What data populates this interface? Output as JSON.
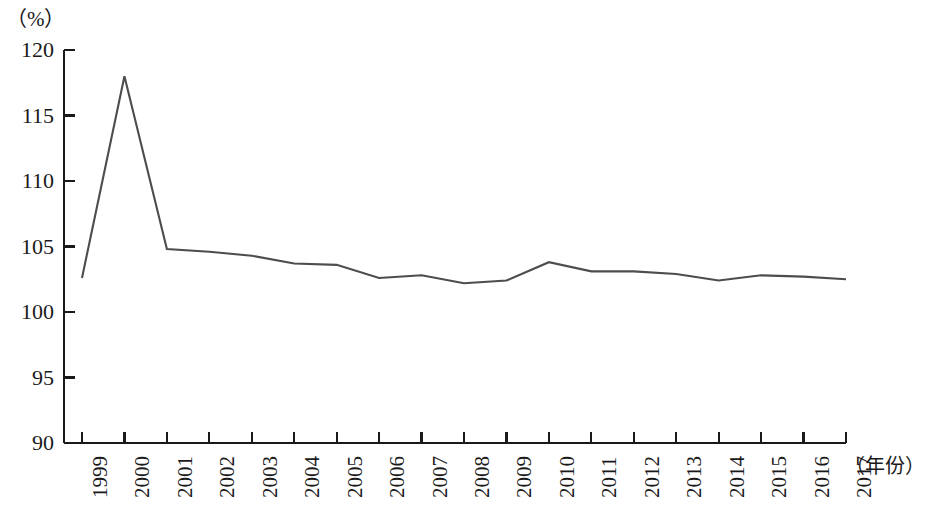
{
  "chart_data": {
    "type": "line",
    "title": "",
    "subtitle": "",
    "unit_label": "（%）",
    "xlabel": "（年份）",
    "ylabel": "",
    "grid": false,
    "legend": null,
    "ylim": [
      90,
      120
    ],
    "yticks": [
      120,
      115,
      110,
      105,
      100,
      95,
      90
    ],
    "ytick_labels": [
      "120",
      "115",
      "110",
      "105",
      "100",
      "95",
      "90"
    ],
    "categories": [
      "1999",
      "2000",
      "2001",
      "2002",
      "2003",
      "2004",
      "2005",
      "2006",
      "2007",
      "2008",
      "2009",
      "2010",
      "2011",
      "2012",
      "2013",
      "2014",
      "2015",
      "2016",
      "2017"
    ],
    "x": [
      1999,
      2000,
      2001,
      2002,
      2003,
      2004,
      2005,
      2006,
      2007,
      2008,
      2009,
      2010,
      2011,
      2012,
      2013,
      2014,
      2015,
      2016,
      2017
    ],
    "values": [
      102.6,
      118.0,
      104.8,
      104.6,
      104.3,
      103.7,
      103.6,
      102.6,
      102.8,
      102.2,
      102.4,
      103.8,
      103.1,
      103.1,
      102.9,
      102.4,
      102.8,
      102.7,
      102.5
    ],
    "series": [
      {
        "name": "",
        "color": "#4d4d4d",
        "values": [
          102.6,
          118.0,
          104.8,
          104.6,
          104.3,
          103.7,
          103.6,
          102.6,
          102.8,
          102.2,
          102.4,
          103.8,
          103.1,
          103.1,
          102.9,
          102.4,
          102.8,
          102.7,
          102.5
        ]
      }
    ],
    "axis_color": "#1a1a1a",
    "line_color": "#4d4d4d"
  }
}
